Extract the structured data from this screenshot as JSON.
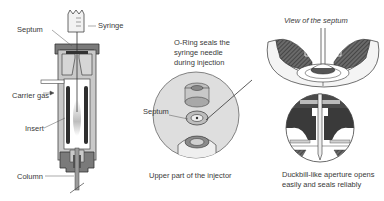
{
  "diagram": {
    "left_panel": {
      "labels": {
        "septum": "Septum",
        "syringe": "Syringe",
        "carrier_gas": "Carrier gas",
        "insert": "Insert",
        "column": "Column"
      }
    },
    "middle_panel": {
      "caption_top": "O-Ring seals the syringe needle during injection",
      "caption_top_lines": [
        "O-Ring seals the",
        "syringe needle",
        "during injection"
      ],
      "septum_label": "Septum",
      "caption_bottom": "Upper part of the injector"
    },
    "right_panel": {
      "title_top": "View of the septum",
      "caption_bottom_lines": [
        "Duckbill-like aperture opens",
        "easily and seals reliably"
      ]
    },
    "colors": {
      "outline": "#333333",
      "dark_fill": "#555555",
      "mid_fill": "#9a9a9a",
      "light_fill": "#cfcfcf",
      "circle_bg": "#dedede",
      "text": "#3a3a3a"
    }
  }
}
